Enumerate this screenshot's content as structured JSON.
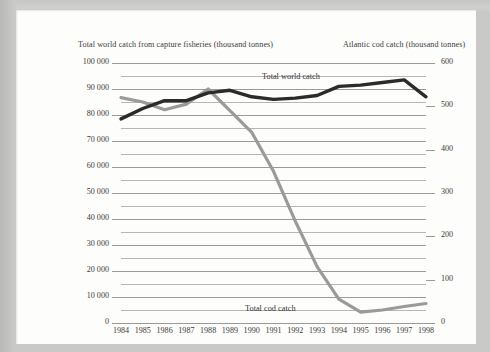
{
  "page": {
    "background_color": "#fdfdfc",
    "frame_color": "#c9c9c7"
  },
  "titles": {
    "left_axis_title": "Total world catch from capture fisheries (thousand tonnes)",
    "right_axis_title": "Atlantic cod catch (thousand tonnes)"
  },
  "series_labels": {
    "world": "Total world catch",
    "cod": "Total cod catch"
  },
  "colors": {
    "world_line": "#2b2b2b",
    "cod_line": "#9a9a98",
    "gridline": "#b6b6b4",
    "axis": "#8e8e8c",
    "text": "#3a3a3a"
  },
  "axes": {
    "left_ticks": [
      "0",
      "10 000",
      "20 000",
      "30 000",
      "40 000",
      "50 000",
      "60 000",
      "70 000",
      "80 000",
      "90 000",
      "100 000"
    ],
    "right_ticks": [
      "0",
      "100",
      "200",
      "300",
      "400",
      "500",
      "600"
    ],
    "x_ticks": [
      "1984",
      "1985",
      "1986",
      "1987",
      "1988",
      "1989",
      "1990",
      "1991",
      "1992",
      "1993",
      "1994",
      "1995",
      "1996",
      "1997",
      "1998"
    ]
  },
  "chart_data": {
    "type": "line",
    "title": "",
    "xlabel": "",
    "ylabel": "Total world catch from capture fisheries (thousand tonnes)",
    "y2label": "Atlantic cod catch (thousand tonnes)",
    "grid": true,
    "legend": "inline-annotation",
    "x": [
      1984,
      1985,
      1986,
      1987,
      1988,
      1989,
      1990,
      1991,
      1992,
      1993,
      1994,
      1995,
      1996,
      1997,
      1998
    ],
    "ylim": [
      0,
      100000
    ],
    "y2lim": [
      0,
      600
    ],
    "series": [
      {
        "name": "Total world catch",
        "axis": "left",
        "unit": "thousand tonnes",
        "color": "#2b2b2b",
        "values": [
          78500,
          82500,
          85500,
          85500,
          88500,
          89500,
          87000,
          86000,
          86500,
          87500,
          91000,
          91500,
          92500,
          93500,
          87000
        ]
      },
      {
        "name": "Total cod catch",
        "axis": "right",
        "unit": "thousand tonnes",
        "color": "#9a9a98",
        "values": [
          520,
          510,
          492,
          505,
          540,
          490,
          440,
          350,
          235,
          130,
          55,
          25,
          30,
          38,
          45
        ]
      }
    ]
  }
}
